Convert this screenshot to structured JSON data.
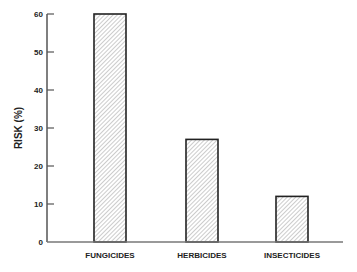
{
  "chart_data": {
    "type": "bar",
    "title": "",
    "xlabel": "",
    "ylabel": "RISK (%)",
    "categories": [
      "FUNGICIDES",
      "HERBICIDES",
      "INSECTICIDES"
    ],
    "values": [
      60,
      27,
      12
    ],
    "ylim": [
      0,
      60
    ],
    "yticks": [
      0,
      10,
      20,
      30,
      40,
      50,
      60
    ],
    "grid": false,
    "legend": null,
    "bar_fill": "diagonal hatch",
    "colors": {
      "bar_edge": "#222222",
      "hatch": "#9a9a9a",
      "axis": "#555555"
    }
  },
  "caption_fragment": "FIG. 2.1 ..."
}
